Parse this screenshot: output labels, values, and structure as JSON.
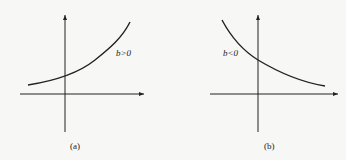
{
  "panels": [
    {
      "id": "a",
      "label": "b>0",
      "caption": "(a)",
      "trend": "increasing exponential"
    },
    {
      "id": "b",
      "label": "b<0",
      "caption": "(b)",
      "trend": "decreasing exponential"
    }
  ],
  "colors": {
    "ink": "#222222",
    "background": "#f7f7f5"
  }
}
